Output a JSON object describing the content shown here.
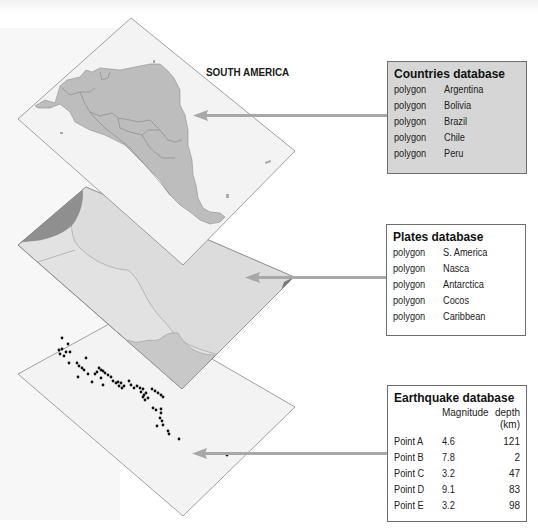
{
  "diagram": {
    "map_title": "SOUTH AMERICA",
    "colors": {
      "layer_fill": "#f1f1f1",
      "layer_border": "#8a8a8a",
      "land_fill": "#bdbdbd",
      "plate_fill": "#dcdcdc",
      "plate_dark": "#8f8f8f",
      "plate_mid": "#c8c8c8",
      "arrow": "#a8a8a8",
      "box_gray": "#d6d6d6",
      "quake_dot": "#111111"
    },
    "layers": [
      {
        "name": "countries-layer",
        "arrow_target": "countries"
      },
      {
        "name": "plates-layer",
        "arrow_target": "plates"
      },
      {
        "name": "earthquake-layer",
        "arrow_target": "earthquakes"
      }
    ]
  },
  "countries": {
    "title": "Countries database",
    "rows": [
      {
        "type": "polygon",
        "name": "Argentina"
      },
      {
        "type": "polygon",
        "name": "Bolivia"
      },
      {
        "type": "polygon",
        "name": "Brazil"
      },
      {
        "type": "polygon",
        "name": "Chile"
      },
      {
        "type": "polygon",
        "name": "Peru"
      }
    ]
  },
  "plates": {
    "title": "Plates database",
    "rows": [
      {
        "type": "polygon",
        "name": "S. America"
      },
      {
        "type": "polygon",
        "name": "Nasca"
      },
      {
        "type": "polygon",
        "name": "Antarctica"
      },
      {
        "type": "polygon",
        "name": "Cocos"
      },
      {
        "type": "polygon",
        "name": "Caribbean"
      }
    ]
  },
  "earthquakes": {
    "title": "Earthquake database",
    "col_magnitude": "Magnitude",
    "col_depth_1": "depth",
    "col_depth_2": "(km)",
    "rows": [
      {
        "point": "Point A",
        "magnitude": "4.6",
        "depth": "121"
      },
      {
        "point": "Point B",
        "magnitude": "7.8",
        "depth": "2"
      },
      {
        "point": "Point C",
        "magnitude": "3.2",
        "depth": "47"
      },
      {
        "point": "Point D",
        "magnitude": "9.1",
        "depth": "83"
      },
      {
        "point": "Point E",
        "magnitude": "3.2",
        "depth": "98"
      }
    ]
  }
}
